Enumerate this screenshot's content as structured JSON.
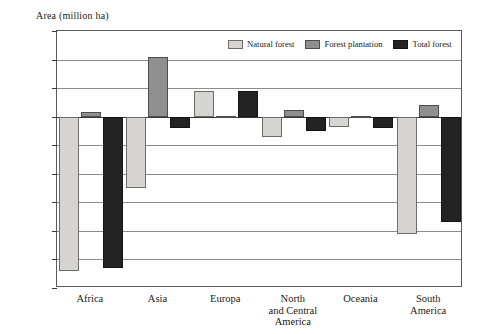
{
  "chart_data": {
    "type": "bar",
    "title": "",
    "ylabel": "Area (million ha)",
    "xlabel": "",
    "ylim": [
      -6.0,
      3.0
    ],
    "ytick_step": 1.0,
    "yticks": [
      "3.0",
      "2.0",
      "1.0",
      "0.0",
      "-1.0",
      "-2.0",
      "-3.0",
      "-4.0",
      "-5.0",
      "-6.0"
    ],
    "ytick_values": [
      3.0,
      2.0,
      1.0,
      0.0,
      -1.0,
      -2.0,
      -3.0,
      -4.0,
      -5.0,
      -6.0
    ],
    "grid": true,
    "zero_line": true,
    "legend_position": "top-center",
    "categories": [
      "Africa",
      "Asia",
      "Europa",
      "North\nand Central\nAmerica",
      "Oceania",
      "South\nAmerica"
    ],
    "series": [
      {
        "name": "Natural forest",
        "color": "#d6d4d0",
        "values": [
          -5.4,
          -2.5,
          0.9,
          -0.7,
          -0.35,
          -4.1
        ]
      },
      {
        "name": "Forest plantation",
        "color": "#8f8f8f",
        "values": [
          0.15,
          2.1,
          0.02,
          0.25,
          0.02,
          0.4
        ]
      },
      {
        "name": "Total forest",
        "color": "#232323",
        "values": [
          -5.3,
          -0.4,
          0.9,
          -0.5,
          -0.4,
          -3.7
        ]
      }
    ]
  }
}
